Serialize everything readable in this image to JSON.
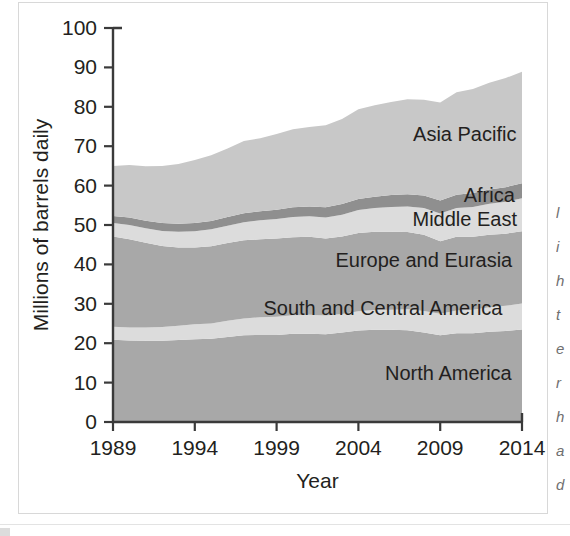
{
  "figure": {
    "yaxis_title": "Millions of barrels daily",
    "xaxis_title": "Year"
  },
  "chart_data": {
    "type": "area",
    "title": "",
    "xlabel": "Year",
    "ylabel": "Millions of barrels daily",
    "xlim": [
      1989,
      2014
    ],
    "ylim": [
      0,
      100
    ],
    "grid": false,
    "stacked": true,
    "legend": "inline-labels",
    "xtick_labels": [
      "1989",
      "1994",
      "1999",
      "2004",
      "2009",
      "2014"
    ],
    "ytick_labels": [
      "0",
      "10",
      "20",
      "30",
      "40",
      "50",
      "60",
      "70",
      "80",
      "90",
      "100"
    ],
    "x": [
      1989,
      1990,
      1991,
      1992,
      1993,
      1994,
      1995,
      1996,
      1997,
      1998,
      1999,
      2000,
      2001,
      2002,
      2003,
      2004,
      2005,
      2006,
      2007,
      2008,
      2009,
      2010,
      2011,
      2012,
      2013,
      2014
    ],
    "series": [
      {
        "name": "North America",
        "color": "#a8a8a8",
        "values": [
          20.9,
          20.7,
          20.6,
          20.6,
          20.8,
          21.0,
          21.1,
          21.6,
          22.0,
          22.1,
          22.1,
          22.4,
          22.4,
          22.3,
          22.7,
          23.2,
          23.4,
          23.4,
          23.3,
          22.7,
          22.0,
          22.5,
          22.5,
          22.9,
          23.1,
          23.5
        ]
      },
      {
        "name": "South and Central America",
        "color": "#dcdcdc",
        "values": [
          3.3,
          3.3,
          3.4,
          3.5,
          3.6,
          3.8,
          3.9,
          4.1,
          4.3,
          4.5,
          4.6,
          4.7,
          4.8,
          4.7,
          4.7,
          4.9,
          5.0,
          5.1,
          5.3,
          5.5,
          5.5,
          5.8,
          6.0,
          6.2,
          6.4,
          6.6
        ]
      },
      {
        "name": "Europe and Eurasia",
        "color": "#a8a8a8",
        "values": [
          22.9,
          22.4,
          21.5,
          20.6,
          19.9,
          19.5,
          19.6,
          19.7,
          19.8,
          19.8,
          19.9,
          19.8,
          19.8,
          19.6,
          19.7,
          19.9,
          19.9,
          19.8,
          19.6,
          19.3,
          18.4,
          18.7,
          18.5,
          18.4,
          18.3,
          18.3
        ]
      },
      {
        "name": "Middle East",
        "color": "#dcdcdc",
        "values": [
          3.4,
          3.6,
          3.7,
          3.8,
          4.0,
          4.1,
          4.3,
          4.4,
          4.6,
          4.8,
          4.9,
          5.1,
          5.2,
          5.3,
          5.5,
          5.8,
          6.0,
          6.3,
          6.5,
          6.8,
          7.0,
          7.3,
          7.6,
          7.9,
          8.1,
          8.4
        ]
      },
      {
        "name": "Africa",
        "color": "#8f8f8f",
        "values": [
          1.8,
          1.9,
          1.9,
          2.0,
          2.0,
          2.1,
          2.1,
          2.2,
          2.3,
          2.3,
          2.4,
          2.5,
          2.5,
          2.6,
          2.7,
          2.8,
          2.9,
          3.0,
          3.1,
          3.2,
          3.3,
          3.4,
          3.5,
          3.6,
          3.7,
          3.8
        ]
      },
      {
        "name": "Asia Pacific",
        "color": "#c8c8c8",
        "values": [
          12.7,
          13.3,
          13.8,
          14.5,
          15.2,
          16.0,
          16.7,
          17.4,
          18.3,
          18.5,
          19.2,
          19.8,
          20.2,
          20.8,
          21.6,
          22.8,
          23.2,
          23.6,
          24.1,
          24.3,
          24.9,
          26.0,
          26.4,
          27.1,
          27.7,
          28.3
        ]
      }
    ],
    "totals_note": [
      65,
      65.2,
      64.9,
      65.0,
      65.5,
      66.5,
      67.7,
      69.4,
      71.3,
      72.0,
      73.1,
      74.3,
      74.9,
      75.3,
      76.9,
      79.4,
      80.4,
      81.2,
      81.9,
      81.8,
      81.1,
      83.7,
      84.5,
      86.1,
      87.3,
      88.9
    ],
    "annotations": [
      {
        "text": "Asia Pacific",
        "x": 2010.5,
        "y": 73.0
      },
      {
        "text": "Africa",
        "x": 2012.0,
        "y": 57.5
      },
      {
        "text": "Middle East",
        "x": 2010.5,
        "y": 51.5
      },
      {
        "text": "Europe and Eurasia",
        "x": 2008.0,
        "y": 41.0
      },
      {
        "text": "South and Central America",
        "x": 2005.5,
        "y": 29.0
      },
      {
        "text": "North America",
        "x": 2009.5,
        "y": 12.5
      }
    ]
  },
  "edge_fragment": {
    "lines": [
      "l",
      "i",
      "h",
      "t",
      "e",
      "r",
      "h",
      "a",
      "d"
    ]
  }
}
